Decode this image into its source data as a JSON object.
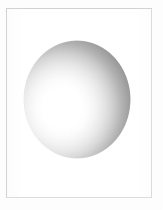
{
  "figure": {
    "caption": "",
    "canvas": {
      "width_px": 163,
      "height_px": 210,
      "background_color": "#fdfdfd"
    },
    "frame": {
      "name": "thin rectangular border",
      "left_px": 6,
      "top_px": 8,
      "width_px": 146,
      "height_px": 190,
      "border_width_px": 1,
      "border_color_top_left": "#d2d2d2",
      "border_color_bottom_right": "#dcdcdc",
      "fill_color": "#ffffff"
    },
    "labels": []
  },
  "chart_data": {
    "type": "scatter",
    "subtitle": "",
    "xlabel": "",
    "ylabel": "",
    "grid": false,
    "legend_position": "none",
    "xlim": [
      0,
      163
    ],
    "ylim": [
      0,
      210
    ],
    "annotations": [],
    "tick_labels": {
      "x": [],
      "y": []
    },
    "series": [
      {
        "name": "sphere",
        "shape": "circle",
        "center_x_px": 77,
        "center_y_px": 99,
        "radius_x_px": 54,
        "radius_y_px": 59,
        "bounds_px": {
          "left": 23,
          "top": 40,
          "right": 131,
          "bottom": 159
        },
        "shading": "radial-gradient",
        "highlight_center_pct": {
          "x": 36,
          "y": 57
        },
        "highlight_center_px": {
          "x": 62,
          "y": 108
        },
        "gradient_stops": [
          {
            "offset_pct": 0,
            "color": "#ffffff"
          },
          {
            "offset_pct": 26,
            "color": "#ffffff"
          },
          {
            "offset_pct": 36,
            "color": "#fbfbfb"
          },
          {
            "offset_pct": 46,
            "color": "#f3f3f3"
          },
          {
            "offset_pct": 56,
            "color": "#e7e7e7"
          },
          {
            "offset_pct": 65,
            "color": "#d8d8d8"
          },
          {
            "offset_pct": 74,
            "color": "#c7c7c7"
          },
          {
            "offset_pct": 82,
            "color": "#b6b6b6"
          },
          {
            "offset_pct": 90,
            "color": "#a7a7a7"
          },
          {
            "offset_pct": 96,
            "color": "#9d9d9d"
          },
          {
            "offset_pct": 100,
            "color": "#999999"
          }
        ],
        "rim_color_darkest": "#999999",
        "core_color_brightest": "#ffffff",
        "outline": "none"
      }
    ]
  },
  "colors": {
    "page_background": "#fdfdfd",
    "plate_fill": "#ffffff",
    "frame_line": "#d2d2d2",
    "sphere_highlight": "#ffffff",
    "sphere_midtone": "#c7c7c7",
    "sphere_shadow": "#999999"
  }
}
